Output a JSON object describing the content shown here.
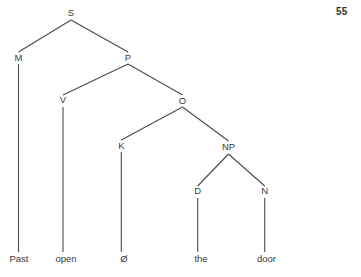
{
  "page": {
    "width": 361,
    "height": 277,
    "background_color": "#ffffff",
    "page_number": "55"
  },
  "diagram": {
    "type": "syntax-tree",
    "line_color": "#4a4a4a",
    "text_color": "#3a3a3a",
    "nodes": [
      {
        "id": "S",
        "label": "S",
        "x": 71,
        "y": 16,
        "kind": "category"
      },
      {
        "id": "M",
        "label": "M",
        "x": 18.5,
        "y": 60.5,
        "kind": "category"
      },
      {
        "id": "P",
        "label": "P",
        "x": 128,
        "y": 60.5,
        "kind": "category"
      },
      {
        "id": "V",
        "label": "V",
        "x": 63,
        "y": 103,
        "kind": "category"
      },
      {
        "id": "O",
        "label": "O",
        "x": 182.5,
        "y": 103.5,
        "kind": "category"
      },
      {
        "id": "K",
        "label": "K",
        "x": 121.3,
        "y": 148.5,
        "kind": "category"
      },
      {
        "id": "NP",
        "label": "NP",
        "x": 228.5,
        "y": 150,
        "kind": "category"
      },
      {
        "id": "D",
        "label": "D",
        "x": 197.7,
        "y": 194,
        "kind": "category"
      },
      {
        "id": "N",
        "label": "N",
        "x": 264.7,
        "y": 194.3,
        "kind": "category"
      },
      {
        "id": "w1",
        "label": "Past",
        "x": 19,
        "y": 262,
        "kind": "terminal"
      },
      {
        "id": "w2",
        "label": "open",
        "x": 66,
        "y": 262,
        "kind": "terminal"
      },
      {
        "id": "w3",
        "label": "Ø",
        "x": 124,
        "y": 262,
        "kind": "terminal"
      },
      {
        "id": "w4",
        "label": "the",
        "x": 201,
        "y": 262,
        "kind": "terminal"
      },
      {
        "id": "w5",
        "label": "door",
        "x": 266.5,
        "y": 262,
        "kind": "terminal"
      }
    ],
    "edges": [
      {
        "from": "S",
        "to": "M",
        "x1": 71,
        "y1": 20,
        "x2": 18.5,
        "y2": 52
      },
      {
        "from": "S",
        "to": "P",
        "x1": 71,
        "y1": 20,
        "x2": 128,
        "y2": 52
      },
      {
        "from": "P",
        "to": "V",
        "x1": 128,
        "y1": 64,
        "x2": 63,
        "y2": 95
      },
      {
        "from": "P",
        "to": "O",
        "x1": 128,
        "y1": 64,
        "x2": 182.5,
        "y2": 95
      },
      {
        "from": "O",
        "to": "K",
        "x1": 182.5,
        "y1": 107,
        "x2": 121.3,
        "y2": 140
      },
      {
        "from": "O",
        "to": "NP",
        "x1": 182.5,
        "y1": 107,
        "x2": 228.5,
        "y2": 141
      },
      {
        "from": "NP",
        "to": "D",
        "x1": 228.5,
        "y1": 154,
        "x2": 197.7,
        "y2": 186
      },
      {
        "from": "NP",
        "to": "N",
        "x1": 228.5,
        "y1": 154,
        "x2": 264.7,
        "y2": 186
      },
      {
        "from": "M",
        "to": "w1",
        "x1": 18.5,
        "y1": 64,
        "x2": 18.5,
        "y2": 252
      },
      {
        "from": "V",
        "to": "w2",
        "x1": 63,
        "y1": 107,
        "x2": 63,
        "y2": 252
      },
      {
        "from": "K",
        "to": "w3",
        "x1": 121.3,
        "y1": 152,
        "x2": 121.3,
        "y2": 252
      },
      {
        "from": "D",
        "to": "w4",
        "x1": 197.7,
        "y1": 198,
        "x2": 197.7,
        "y2": 252
      },
      {
        "from": "N",
        "to": "w5",
        "x1": 264.7,
        "y1": 198,
        "x2": 264.7,
        "y2": 252
      }
    ]
  }
}
